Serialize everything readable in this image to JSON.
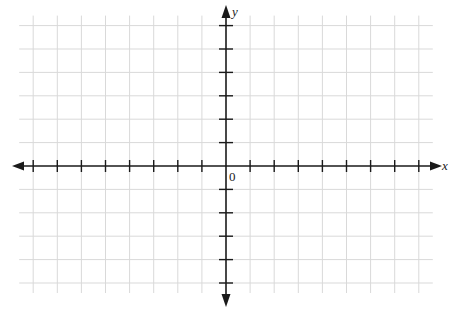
{
  "diagram": {
    "type": "coordinate-plane",
    "x_axis_label": "x",
    "y_axis_label": "y",
    "origin_label": "0",
    "x_ticks_negative": 8,
    "x_ticks_positive": 8,
    "y_ticks_positive": 6,
    "y_ticks_negative": 5,
    "grid": true,
    "colors": {
      "axis": "#1a1a1a",
      "grid": "#d9d9d9",
      "background": "#ffffff"
    }
  }
}
